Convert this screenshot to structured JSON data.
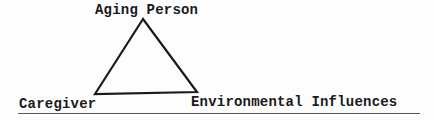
{
  "diagram": {
    "type": "triangle",
    "nodes": [
      {
        "id": "top",
        "label": "Aging Person"
      },
      {
        "id": "bottom-left",
        "label": "Caregiver"
      },
      {
        "id": "bottom-right",
        "label": "Environmental Influences"
      }
    ],
    "edges": [
      [
        "top",
        "bottom-left"
      ],
      [
        "top",
        "bottom-right"
      ],
      [
        "bottom-left",
        "bottom-right"
      ]
    ],
    "stroke_color": "#1a1a1a",
    "underline": true
  }
}
